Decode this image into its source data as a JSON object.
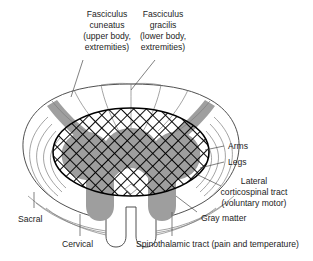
{
  "figure": {
    "colors": {
      "gray_matter": "#9e9e9e",
      "outline": "#3c3c3c",
      "inner_line": "#7d7d7d",
      "hatch": "#000000",
      "text": "#1d1d1d",
      "background": "#ffffff"
    }
  },
  "labels": {
    "fasciculus_cuneatus": {
      "line1": "Fasciculus",
      "line2": "cuneatus",
      "line3": "(upper body,",
      "line4": "extremities)"
    },
    "fasciculus_gracilis": {
      "line1": "Fasciculus",
      "line2": "gracilis",
      "line3": "(lower body,",
      "line4": "extremities)"
    },
    "arms": "Arms",
    "legs": "Legs",
    "lateral_corticospinal": {
      "line1": "Lateral",
      "line2": "corticospinal tract",
      "line3": "(voluntary motor)"
    },
    "gray_matter": "Gray matter",
    "sacral": "Sacral",
    "cervical": "Cervical",
    "spinothalamic": "Spinothalamic tract (pain and temperature)"
  }
}
